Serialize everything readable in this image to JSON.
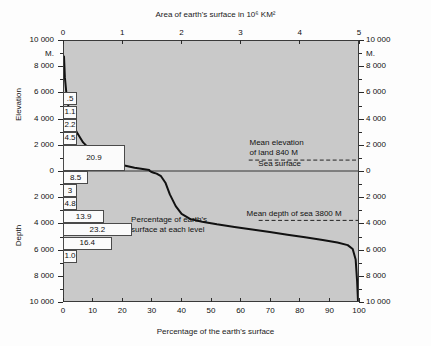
{
  "chart_data": {
    "type": "line",
    "title": "Area of earth's surface in 10⁶ KM²",
    "subtitle": "",
    "xlabel": "Percentage of the earth's surface",
    "ylabel": "Elevation / Depth",
    "top_axis": {
      "label": "Area of earth's surface in 10⁶ KM²",
      "ticks": [
        "0",
        "1",
        "2",
        "3",
        "4",
        "5"
      ],
      "range": [
        0,
        5
      ],
      "units": "10^6 KM^2"
    },
    "bottom_axis": {
      "label": "Percentage of the earth's surface",
      "ticks": [
        "0",
        "10",
        "20",
        "30",
        "40",
        "50",
        "60",
        "70",
        "80",
        "90",
        "100"
      ],
      "range": [
        0,
        100
      ],
      "units": "percent"
    },
    "left_axis": {
      "upper_name": "Elevation",
      "lower_name": "Depth",
      "unit_label": "M.",
      "ticks": [
        "10 000",
        "8 000",
        "6 000",
        "4 000",
        "2 000",
        "0",
        "2 000",
        "4 000",
        "6 000",
        "8 000",
        "10 000"
      ],
      "range_elevation": [
        0,
        10000
      ],
      "range_depth": [
        0,
        10000
      ]
    },
    "right_axis": {
      "unit_label": "M.",
      "ticks": [
        "10 000",
        "8 000",
        "6 000",
        "4 000",
        "2 000",
        "0",
        "2 000",
        "4 000",
        "6 000",
        "8 000",
        "10 000"
      ]
    },
    "grid": false,
    "legend": "none",
    "annotations": [
      {
        "name": "sea-surface",
        "text": "Sea surface",
        "level_m": 0
      },
      {
        "name": "mean-elevation-land",
        "text": "Mean elevation\nof land 840 M",
        "line1": "Mean elevation",
        "line2": "of land 840 M",
        "value_m": 840
      },
      {
        "name": "mean-depth-sea",
        "text": "Mean depth of sea 3800 M",
        "value_m": -3800
      },
      {
        "name": "percentage-callout",
        "line1": "Percentage of earth's",
        "line2": "surface at each level"
      }
    ],
    "level_bands": [
      {
        "label": ".5",
        "value": 0.5,
        "band_top_m": 6000,
        "band_bottom_m": 5000
      },
      {
        "label": "1.1",
        "value": 1.1,
        "band_top_m": 5000,
        "band_bottom_m": 4000
      },
      {
        "label": "2.2",
        "value": 2.2,
        "band_top_m": 4000,
        "band_bottom_m": 3000
      },
      {
        "label": "4.5",
        "value": 4.5,
        "band_top_m": 3000,
        "band_bottom_m": 2000
      },
      {
        "label": "20.9",
        "value": 20.9,
        "band_top_m": 2000,
        "band_bottom_m": 0
      },
      {
        "label": "8.5",
        "value": 8.5,
        "band_top_m": 0,
        "band_bottom_m": -1000
      },
      {
        "label": "3",
        "value": 3.0,
        "band_top_m": -1000,
        "band_bottom_m": -2000
      },
      {
        "label": "4.8",
        "value": 4.8,
        "band_top_m": -2000,
        "band_bottom_m": -3000
      },
      {
        "label": "13.9",
        "value": 13.9,
        "band_top_m": -3000,
        "band_bottom_m": -4000
      },
      {
        "label": "23.2",
        "value": 23.2,
        "band_top_m": -4000,
        "band_bottom_m": -5000
      },
      {
        "label": "16.4",
        "value": 16.4,
        "band_top_m": -5000,
        "band_bottom_m": -6000
      },
      {
        "label": "1.0",
        "value": 1.0,
        "band_top_m": -6000,
        "band_bottom_m": -7000
      }
    ],
    "curve": {
      "name": "hypsographic-curve",
      "x": [
        0,
        0.3,
        0.8,
        1.5,
        2.6,
        4.3,
        6.5,
        9.5,
        14,
        19,
        24,
        29,
        29.2,
        29.6,
        30.5,
        31.5,
        33,
        34.5,
        36,
        38,
        40,
        43,
        47,
        52,
        58,
        64,
        70,
        76,
        82,
        88,
        93,
        96.5,
        98.2,
        99.2,
        99.7,
        100
      ],
      "y_m": [
        8800,
        7200,
        6000,
        5000,
        4000,
        3000,
        2200,
        1500,
        900,
        500,
        250,
        80,
        0,
        -60,
        -130,
        -200,
        -400,
        -900,
        -1800,
        -2700,
        -3300,
        -3700,
        -3900,
        -4100,
        -4300,
        -4500,
        -4700,
        -4900,
        -5100,
        -5300,
        -5500,
        -5700,
        -6000,
        -6800,
        -8500,
        -10000
      ]
    },
    "colors": {
      "plot_background": "#c9c9c9",
      "curve": "#111111",
      "bar_fill": "#fbfbfb",
      "axis": "#2b2b2b",
      "text": "#111111"
    }
  }
}
